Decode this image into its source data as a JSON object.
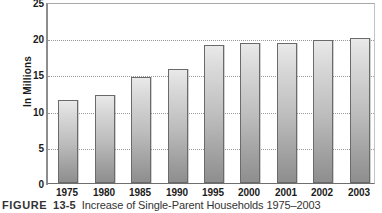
{
  "chart_data": {
    "type": "bar",
    "title": "Increase of Single-Parent Households 1975–2003",
    "xlabel": "",
    "ylabel": "In Millions",
    "categories": [
      "1975",
      "1980",
      "1985",
      "1990",
      "1995",
      "2000",
      "2001",
      "2002",
      "2003"
    ],
    "values": [
      11.5,
      12.2,
      14.6,
      15.8,
      19.0,
      19.4,
      19.4,
      19.7,
      20.0
    ],
    "ylim": [
      0,
      25
    ],
    "yticks": [
      0,
      5,
      10,
      15,
      20,
      25
    ],
    "ytick_labels": [
      "0",
      "5",
      "10",
      "15",
      "20",
      "25"
    ],
    "grid": "horizontal-dotted",
    "legend": "none",
    "bar_color": "#bdbdbd",
    "bar_edge_color": "#6a6a6a",
    "axis_color": "#8f8f8f",
    "grid_color": "#9a9a9a",
    "text_color": "#1b1b1b"
  },
  "caption": {
    "figure_word": "FIGURE",
    "figure_number": "13-5",
    "figure_title": "Increase of Single-Parent Households 1975–2003"
  }
}
